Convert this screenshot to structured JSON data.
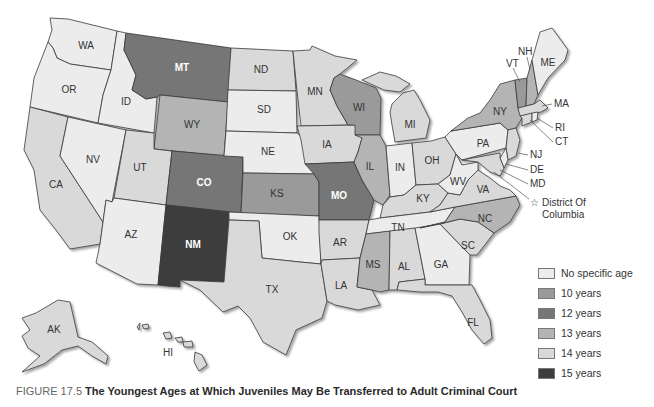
{
  "figure": {
    "number_label": "FIGURE 17.5",
    "title": "The Youngest Ages at Which Juveniles May Be Transferred to Adult Criminal Court"
  },
  "legend": {
    "items": [
      {
        "key": "none",
        "label": "No specific age",
        "color": "#ececec"
      },
      {
        "key": "y10",
        "label": "10 years",
        "color": "#9a9a9a"
      },
      {
        "key": "y12",
        "label": "12 years",
        "color": "#767676"
      },
      {
        "key": "y13",
        "label": "13 years",
        "color": "#b4b4b4"
      },
      {
        "key": "y14",
        "label": "14 years",
        "color": "#d9d9d9"
      },
      {
        "key": "y15",
        "label": "15 years",
        "color": "#3d3d3d"
      }
    ]
  },
  "callouts": {
    "NH": "NH",
    "VT": "VT",
    "MA": "MA",
    "RI": "RI",
    "CT": "CT",
    "NJ": "NJ",
    "DE": "DE",
    "MD": "MD",
    "dc_line1": "District Of",
    "dc_line2": "Columbia"
  },
  "states": {
    "WA": {
      "label": "WA",
      "category": "none"
    },
    "OR": {
      "label": "OR",
      "category": "none"
    },
    "ID": {
      "label": "ID",
      "category": "none"
    },
    "MT": {
      "label": "MT",
      "category": "y12"
    },
    "WY": {
      "label": "WY",
      "category": "y13"
    },
    "ND": {
      "label": "ND",
      "category": "y14"
    },
    "SD": {
      "label": "SD",
      "category": "none"
    },
    "NE": {
      "label": "NE",
      "category": "none"
    },
    "MN": {
      "label": "MN",
      "category": "y14"
    },
    "IA": {
      "label": "IA",
      "category": "y14"
    },
    "WI": {
      "label": "WI",
      "category": "y10"
    },
    "MI": {
      "label": "MI",
      "category": "y14"
    },
    "IL": {
      "label": "IL",
      "category": "y13"
    },
    "IN": {
      "label": "IN",
      "category": "none"
    },
    "OH": {
      "label": "OH",
      "category": "y14"
    },
    "PA": {
      "label": "PA",
      "category": "none"
    },
    "NY": {
      "label": "NY",
      "category": "y13"
    },
    "VT": {
      "label": "VT",
      "category": "y10"
    },
    "NH": {
      "label": "NH",
      "category": "y13"
    },
    "ME": {
      "label": "ME",
      "category": "none"
    },
    "MA": {
      "label": "MA",
      "category": "y14"
    },
    "CT": {
      "label": "CT",
      "category": "y14"
    },
    "RI": {
      "label": "RI",
      "category": "none"
    },
    "NJ": {
      "label": "NJ",
      "category": "y14"
    },
    "DE": {
      "label": "DE",
      "category": "none"
    },
    "MD": {
      "label": "MD",
      "category": "y14"
    },
    "CA": {
      "label": "CA",
      "category": "y14"
    },
    "NV": {
      "label": "NV",
      "category": "none"
    },
    "UT": {
      "label": "UT",
      "category": "y14"
    },
    "AZ": {
      "label": "AZ",
      "category": "none"
    },
    "CO": {
      "label": "CO",
      "category": "y12"
    },
    "NM": {
      "label": "NM",
      "category": "y15"
    },
    "KS": {
      "label": "KS",
      "category": "y10"
    },
    "OK": {
      "label": "OK",
      "category": "none"
    },
    "TX": {
      "label": "TX",
      "category": "y14"
    },
    "MO": {
      "label": "MO",
      "category": "y12"
    },
    "AR": {
      "label": "AR",
      "category": "y14"
    },
    "LA": {
      "label": "LA",
      "category": "y14"
    },
    "KY": {
      "label": "KY",
      "category": "y14"
    },
    "TN": {
      "label": "TN",
      "category": "none"
    },
    "MS": {
      "label": "MS",
      "category": "y13"
    },
    "AL": {
      "label": "AL",
      "category": "y14"
    },
    "GA": {
      "label": "GA",
      "category": "none"
    },
    "FL": {
      "label": "FL",
      "category": "y14"
    },
    "SC": {
      "label": "SC",
      "category": "y14"
    },
    "NC": {
      "label": "NC",
      "category": "y13"
    },
    "VA": {
      "label": "VA",
      "category": "y14"
    },
    "WV": {
      "label": "WV",
      "category": "none"
    },
    "AK": {
      "label": "AK",
      "category": "y14"
    },
    "HI": {
      "label": "HI",
      "category": "y14"
    }
  }
}
